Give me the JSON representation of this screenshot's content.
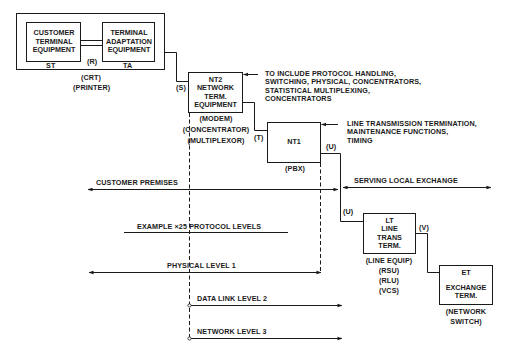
{
  "boxes": {
    "cte": {
      "lines": [
        "CUSTOMER",
        "TERMINAL",
        "EQUIPMENT"
      ]
    },
    "ta": {
      "lines": [
        "TERMINAL",
        "ADAPTATION",
        "EQUIPMENT"
      ]
    },
    "nt2": {
      "lines": [
        "NT2",
        "NETWORK",
        "TERM.",
        "EQUIPMENT"
      ]
    },
    "nt1": {
      "lines": [
        "NT1"
      ]
    },
    "lt": {
      "lines": [
        "LT",
        "LINE",
        "TRANS",
        "TERM."
      ]
    },
    "et": {
      "lines": [
        "ET",
        "",
        "EXCHANGE",
        "TERM."
      ]
    }
  },
  "labels": {
    "st": "ST",
    "ta": "TA",
    "r": "(R)",
    "s": "(S)",
    "t": "(T)",
    "u_top": "(U)",
    "u_bottom": "(U)",
    "v": "(V)",
    "crt": "(CRT)",
    "printer": "(PRINTER)",
    "modem": "(MODEM)",
    "concentrator": "(CONCENTRATOR)",
    "multiplexor": "(MULTIPLEXOR)",
    "pbx": "(PBX)",
    "line_equip": "(LINE EQUIP)",
    "rsu": "(RSU)",
    "rlu": "(RLU)",
    "vcs": "(VCS)",
    "network": "(NETWORK",
    "switch": "SWITCH)"
  },
  "annotations": {
    "nt2_note": [
      "TO INCLUDE PROTOCOL HANDLING,",
      "SWITCHING, PHYSICAL, CONCENTRATORS,",
      "STATISTICAL MULTIPLEXING,",
      "CONCENTRATORS"
    ],
    "nt1_note": [
      "LINE TRANSMISSION TERMINATION,",
      "MAINTENANCE FUNCTIONS,",
      "TIMING"
    ]
  },
  "regions": {
    "customer_premises": "CUSTOMER PREMISES",
    "serving_local_exchange": "SERVING LOCAL EXCHANGE"
  },
  "protocol": {
    "heading": "EXAMPLE ×25  PROTOCOL LEVELS",
    "levels": [
      "PHYSICAL LEVEL 1",
      "DATA LINK LEVEL 2",
      "NETWORK LEVEL 3"
    ]
  },
  "colors": {
    "ink": "#1a1a1a",
    "background": "#ffffff"
  }
}
